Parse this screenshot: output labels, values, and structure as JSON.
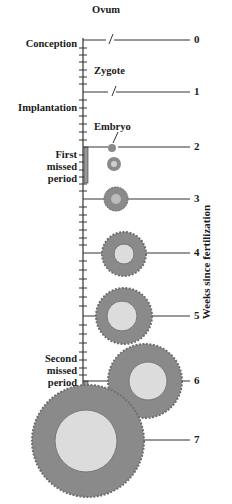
{
  "diagram": {
    "axis_title": "Weeks since fertilization",
    "weeks": [
      {
        "label": "0",
        "y": 40
      },
      {
        "label": "1",
        "y": 92
      },
      {
        "label": "2",
        "y": 147
      },
      {
        "label": "3",
        "y": 199
      },
      {
        "label": "4",
        "y": 253
      },
      {
        "label": "5",
        "y": 316
      },
      {
        "label": "6",
        "y": 381
      },
      {
        "label": "7",
        "y": 440
      }
    ],
    "stage_labels": {
      "ovum": "Ovum",
      "zygote": "Zygote",
      "embryo": "Embryo"
    },
    "events": {
      "conception": "Conception",
      "implantation": "Implantation",
      "first_missed_1": "First",
      "first_missed_2": "missed",
      "first_missed_3": "period",
      "second_missed_1": "Second",
      "second_missed_2": "missed",
      "second_missed_3": "period"
    },
    "colors": {
      "line": "#333333",
      "villi": "#8a8a8a",
      "sac": "#d9d9d9",
      "bar": "#9a9a9a"
    }
  }
}
